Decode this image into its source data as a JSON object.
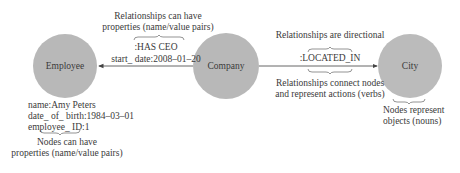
{
  "nodes": [
    {
      "id": "employee",
      "label": "Employee"
    },
    {
      "id": "company",
      "label": "Company"
    },
    {
      "id": "city",
      "label": "City"
    }
  ],
  "relationships": [
    {
      "type": ":HAS CEO",
      "property": "start_ date:2008–01–20",
      "from": "Company",
      "to": "Employee"
    },
    {
      "type": ":LOCATED_IN",
      "from": "Company",
      "to": "City"
    }
  ],
  "employee_properties": [
    "name:Amy Peters",
    "date_ of_ birth:1984–03–01",
    "employee_ ID:1"
  ],
  "annotations": {
    "rel_properties_line1": "Relationships can have",
    "rel_properties_line2": "properties (name/value pairs)",
    "rel_directional": "Relationships are directional",
    "rel_connect_line1": "Relationships connect nodes",
    "rel_connect_line2": "and represent actions (verbs)",
    "node_props_line1": "Nodes can have",
    "node_props_line2": "properties (name/value pairs)",
    "nodes_represent_line1": "Nodes represent",
    "nodes_represent_line2": "objects (nouns)"
  },
  "colors": {
    "node_fill": "#b5b5b5",
    "line": "#444444",
    "text": "#333333"
  }
}
